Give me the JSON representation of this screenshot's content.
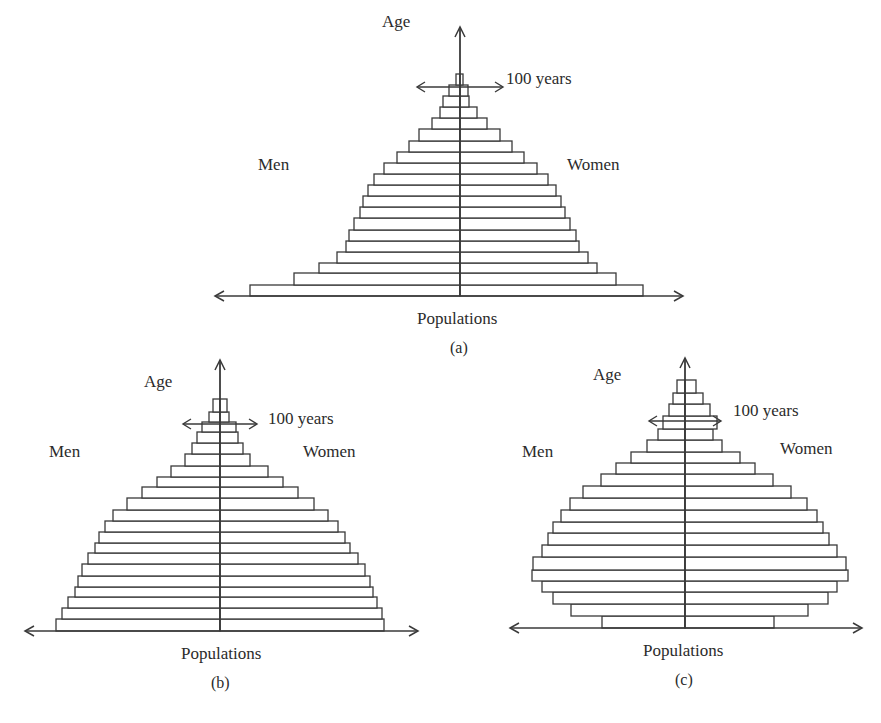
{
  "figure": {
    "panels": [
      {
        "id": "a",
        "caption": "(a)",
        "y_axis_label": "Age",
        "x_axis_label": "Populations",
        "left_label": "Men",
        "right_label": "Women",
        "marker_label": "100 years"
      },
      {
        "id": "b",
        "caption": "(b)",
        "y_axis_label": "Age",
        "x_axis_label": "Populations",
        "left_label": "Men",
        "right_label": "Women",
        "marker_label": "100 years"
      },
      {
        "id": "c",
        "caption": "(c)",
        "y_axis_label": "Age",
        "x_axis_label": "Populations",
        "left_label": "Men",
        "right_label": "Women",
        "marker_label": "100 years"
      }
    ],
    "colors": {
      "line": "#3a3a3a",
      "bar_fill": "#ffffff",
      "text": "#2b2b2b"
    }
  },
  "chart_data": [
    {
      "type": "bar",
      "subtype": "population-pyramid",
      "title": "(a)",
      "xlabel": "Populations",
      "ylabel": "Age",
      "annotation": "100 years",
      "legend": [
        "Men",
        "Women"
      ],
      "note": "Expanding pyramid; values are relative bar widths (px from center axis), age groups ordered from youngest (bottom) to oldest (top).",
      "age_groups": 20,
      "geom": {
        "cx": 460,
        "base_y": 296,
        "top_y": 27,
        "axis_left": 215,
        "axis_right": 683,
        "marker_y": 87,
        "marker_half": 43
      },
      "tops": [
        285,
        273,
        263,
        252,
        241,
        230,
        218,
        207,
        196,
        185,
        174,
        163,
        152,
        141,
        129,
        118,
        107,
        96,
        85,
        74
      ],
      "series": [
        {
          "name": "Men",
          "values": [
            210,
            166,
            141,
            123,
            114,
            111,
            106,
            100,
            97,
            92,
            86,
            76,
            63,
            51,
            41,
            28,
            20,
            17,
            11,
            4
          ]
        },
        {
          "name": "Women",
          "values": [
            183,
            156,
            137,
            128,
            119,
            116,
            110,
            105,
            101,
            96,
            88,
            77,
            64,
            52,
            40,
            27,
            17,
            9,
            8,
            3
          ]
        }
      ]
    },
    {
      "type": "bar",
      "subtype": "population-pyramid",
      "title": "(b)",
      "xlabel": "Populations",
      "ylabel": "Age",
      "annotation": "100 years",
      "legend": [
        "Men",
        "Women"
      ],
      "note": "Expanding pyramid with wider older cohorts; values are relative bar widths (px from center axis).",
      "age_groups": 21,
      "geom": {
        "cx": 220,
        "base_y": 631,
        "top_y": 360,
        "axis_left": 25,
        "axis_right": 418,
        "marker_y": 424,
        "marker_half": 37
      },
      "tops": [
        619,
        608,
        597,
        587,
        576,
        564,
        553,
        543,
        532,
        521,
        510,
        498,
        487,
        477,
        466,
        454,
        443,
        432,
        422,
        412,
        399
      ],
      "series": [
        {
          "name": "Men",
          "values": [
            164,
            158,
            152,
            145,
            142,
            138,
            132,
            125,
            121,
            115,
            107,
            93,
            78,
            63,
            49,
            35,
            28,
            23,
            18,
            11,
            7
          ]
        },
        {
          "name": "Women",
          "values": [
            164,
            162,
            157,
            153,
            150,
            145,
            138,
            130,
            125,
            118,
            108,
            94,
            78,
            63,
            48,
            30,
            23,
            18,
            16,
            9,
            7
          ]
        }
      ]
    },
    {
      "type": "bar",
      "subtype": "population-pyramid",
      "title": "(c)",
      "xlabel": "Populations",
      "ylabel": "Age",
      "annotation": "100 years",
      "legend": [
        "Men",
        "Women"
      ],
      "note": "Contracting (constrictive) pyramid, widest in middle ages; values are relative bar widths (px from center axis).",
      "age_groups": 21,
      "geom": {
        "cx": 685,
        "base_y": 628,
        "top_y": 358,
        "axis_left": 510,
        "axis_right": 862,
        "marker_y": 421,
        "marker_half": 36
      },
      "tops": [
        616,
        604,
        592,
        581,
        570,
        557,
        545,
        533,
        522,
        510,
        498,
        486,
        474,
        463,
        452,
        440,
        429,
        416,
        404,
        393,
        380
      ],
      "series": [
        {
          "name": "Men",
          "values": [
            83,
            114,
            132,
            143,
            153,
            152,
            143,
            137,
            132,
            124,
            115,
            102,
            84,
            69,
            54,
            38,
            27,
            22,
            16,
            12,
            8
          ]
        },
        {
          "name": "Women",
          "values": [
            89,
            123,
            143,
            152,
            163,
            161,
            152,
            144,
            138,
            132,
            122,
            106,
            88,
            70,
            55,
            37,
            28,
            32,
            25,
            18,
            11
          ]
        }
      ]
    }
  ]
}
